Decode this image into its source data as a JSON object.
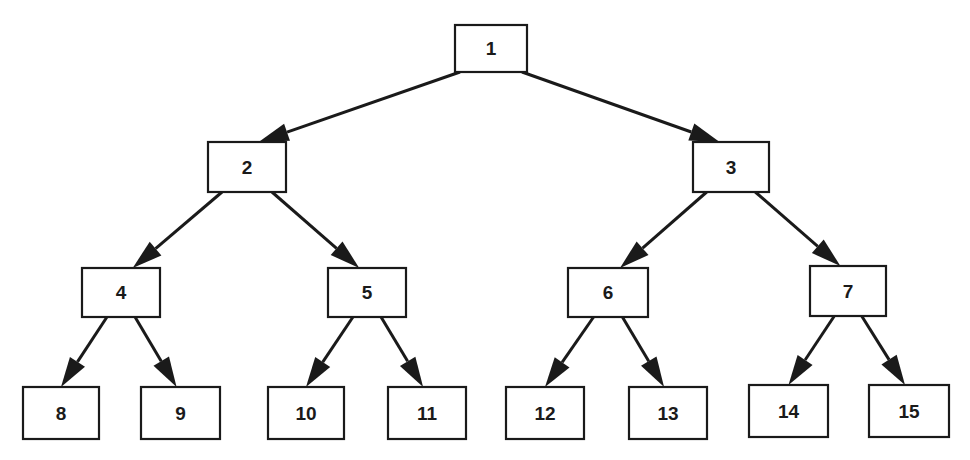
{
  "diagram": {
    "type": "binary-tree",
    "nodes": [
      {
        "id": "1",
        "label": "1"
      },
      {
        "id": "2",
        "label": "2"
      },
      {
        "id": "3",
        "label": "3"
      },
      {
        "id": "4",
        "label": "4"
      },
      {
        "id": "5",
        "label": "5"
      },
      {
        "id": "6",
        "label": "6"
      },
      {
        "id": "7",
        "label": "7"
      },
      {
        "id": "8",
        "label": "8"
      },
      {
        "id": "9",
        "label": "9"
      },
      {
        "id": "10",
        "label": "10"
      },
      {
        "id": "11",
        "label": "11"
      },
      {
        "id": "12",
        "label": "12"
      },
      {
        "id": "13",
        "label": "13"
      },
      {
        "id": "14",
        "label": "14"
      },
      {
        "id": "15",
        "label": "15"
      }
    ],
    "edges": [
      {
        "from": "1",
        "to": "2"
      },
      {
        "from": "1",
        "to": "3"
      },
      {
        "from": "2",
        "to": "4"
      },
      {
        "from": "2",
        "to": "5"
      },
      {
        "from": "3",
        "to": "6"
      },
      {
        "from": "3",
        "to": "7"
      },
      {
        "from": "4",
        "to": "8"
      },
      {
        "from": "4",
        "to": "9"
      },
      {
        "from": "5",
        "to": "10"
      },
      {
        "from": "5",
        "to": "11"
      },
      {
        "from": "6",
        "to": "12"
      },
      {
        "from": "6",
        "to": "13"
      },
      {
        "from": "7",
        "to": "14"
      },
      {
        "from": "7",
        "to": "15"
      }
    ]
  }
}
